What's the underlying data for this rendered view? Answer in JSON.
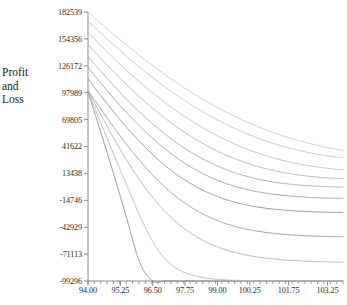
{
  "chart": {
    "type": "line",
    "title": "",
    "ylabel_lines": [
      "Profit",
      "and",
      "Loss"
    ],
    "xlabel": "",
    "grid": false,
    "legend": "none",
    "background_color": "#ffffff",
    "axis_color": "#808080",
    "text_color": "#2b2b2b"
  },
  "y_axis": {
    "ticks": [
      182539,
      154356,
      126172,
      97989,
      69805,
      41622,
      13438,
      -14746,
      -42929,
      -71113,
      -99296
    ],
    "tick_labels": [
      "182539",
      "154356",
      "126172",
      "97989",
      "69805",
      "41622",
      "13438",
      "-14746",
      "-42929",
      "-71113",
      "-99296"
    ],
    "min": -99296,
    "max": 182539,
    "step": 28183
  },
  "x_axis": {
    "ticks": [
      94.0,
      95.25,
      96.5,
      97.75,
      99.0,
      100.25,
      101.75,
      103.25
    ],
    "tick_labels": [
      "94.00",
      "95.25",
      "96.50",
      "97.75",
      "99.00",
      "100.25",
      "101.75",
      "103.25"
    ],
    "min": 94.0,
    "max": 103.85,
    "minor_tick_count": 40
  },
  "chart_data": {
    "type": "line",
    "title": "",
    "xlabel": "",
    "ylabel": "Profit and Loss",
    "xlim": [
      94.0,
      103.85
    ],
    "ylim": [
      -99296,
      182539
    ],
    "grid": false,
    "legend_position": "none",
    "x": [
      94.0,
      94.5,
      95.0,
      95.5,
      96.0,
      96.5,
      97.0,
      97.5,
      98.0,
      98.5,
      99.0,
      99.5,
      100.0,
      100.5,
      101.0,
      101.5,
      102.0,
      102.5,
      103.0,
      103.5,
      103.85
    ],
    "series": [
      {
        "name": "curve-1",
        "color": "#c9c9c9",
        "values": [
          182539,
          170500,
          158800,
          147500,
          136600,
          126200,
          116300,
          107000,
          98200,
          90000,
          82400,
          75400,
          69000,
          63100,
          57800,
          53000,
          48800,
          45100,
          41900,
          39200,
          37600
        ]
      },
      {
        "name": "curve-2",
        "color": "#c4c4c4",
        "values": [
          173000,
          160200,
          147800,
          135900,
          124500,
          113700,
          103500,
          94000,
          85100,
          76900,
          69400,
          62600,
          56500,
          51000,
          46200,
          42000,
          38400,
          35400,
          32900,
          30900,
          29800
        ]
      },
      {
        "name": "curve-3",
        "color": "#bdbdbd",
        "values": [
          161000,
          147200,
          133900,
          121200,
          109100,
          97800,
          87200,
          77400,
          68400,
          60200,
          52800,
          46200,
          40400,
          35300,
          30900,
          27200,
          24100,
          21600,
          19600,
          18100,
          17200
        ]
      },
      {
        "name": "curve-4",
        "color": "#b5b5b5",
        "values": [
          148500,
          133800,
          119600,
          106100,
          93400,
          81600,
          70700,
          60800,
          51800,
          43800,
          36800,
          30700,
          25500,
          21100,
          17500,
          14600,
          12300,
          10500,
          9200,
          8300,
          7800
        ]
      },
      {
        "name": "curve-5",
        "color": "#a8a8a8",
        "values": [
          136000,
          120300,
          105200,
          90900,
          77500,
          65200,
          54000,
          44000,
          35200,
          27600,
          21100,
          15700,
          11300,
          7800,
          5100,
          3100,
          1600,
          500,
          -200,
          -700,
          -1000
        ]
      },
      {
        "name": "curve-6",
        "color": "#9e9e9e",
        "values": [
          124500,
          107900,
          91900,
          76800,
          62800,
          50000,
          38500,
          28400,
          19700,
          12300,
          6200,
          1300,
          -2600,
          -5600,
          -7900,
          -9500,
          -10700,
          -11600,
          -12200,
          -12600,
          -12800
        ]
      },
      {
        "name": "curve-7",
        "color": "#8f8f8f",
        "values": [
          112500,
          94700,
          77600,
          61500,
          46600,
          33100,
          21200,
          10900,
          2200,
          -5000,
          -10800,
          -15400,
          -18900,
          -21600,
          -23500,
          -24900,
          -25900,
          -26600,
          -27100,
          -27400,
          -27600
        ]
      },
      {
        "name": "curve-8",
        "color": "#9a9a9a",
        "values": [
          100500,
          80800,
          61600,
          43500,
          26700,
          11600,
          -1600,
          -12900,
          -22300,
          -29900,
          -36000,
          -40700,
          -44300,
          -46900,
          -48900,
          -50300,
          -51300,
          -52000,
          -52500,
          -52800,
          -53000
        ]
      },
      {
        "name": "curve-9",
        "color": "#b0b0b0",
        "values": [
          100000,
          74600,
          50000,
          27000,
          6200,
          -12000,
          -27300,
          -39800,
          -49800,
          -57600,
          -63600,
          -68100,
          -71500,
          -74000,
          -75800,
          -77100,
          -78000,
          -78700,
          -79100,
          -79400,
          -79600
        ]
      },
      {
        "name": "curve-10-expiry",
        "color": "#8a8a8a",
        "values": [
          99000,
          56000,
          12000,
          -34000,
          -80000,
          -99296,
          -99296,
          -99296,
          -99296,
          -99296,
          -99296,
          -99296,
          -99296,
          -99296,
          -99296,
          -99296,
          -99296,
          -99296,
          -99296,
          -99296,
          -99296
        ]
      },
      {
        "name": "curve-11-floor",
        "color": "#b8b8b8",
        "values": [
          99500,
          66000,
          33000,
          1000,
          -31000,
          -58000,
          -77000,
          -87500,
          -93000,
          -96000,
          -97600,
          -98400,
          -98800,
          -99000,
          -99150,
          -99200,
          -99250,
          -99270,
          -99280,
          -99290,
          -99296
        ]
      }
    ]
  }
}
